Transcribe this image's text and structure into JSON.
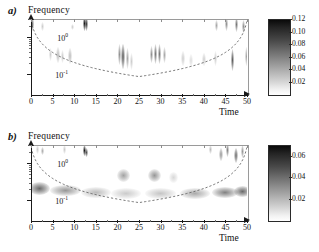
{
  "figure": {
    "type": "wavelet-scalogram-pair",
    "background": "#ffffff"
  },
  "panels": [
    {
      "tag": "a)",
      "ylabel": "Frequency",
      "xlabel": "Time"
    },
    {
      "tag": "b)",
      "ylabel": "Frequency",
      "xlabel": "Time"
    }
  ],
  "axes": {
    "x_ticks": [
      "0",
      "5",
      "10",
      "15",
      "20",
      "25",
      "30",
      "35",
      "40",
      "45",
      "50"
    ],
    "y_ticks": [
      "10",
      "10"
    ],
    "y_exponents": [
      "0",
      "-1"
    ]
  },
  "colorbars": [
    {
      "ticks": [
        "0.12",
        "0.10",
        "0.08",
        "0.06",
        "0.04",
        "0.02"
      ],
      "max": 0.12,
      "min": 0.0
    },
    {
      "ticks": [
        "0.06",
        "0.04",
        "0.02"
      ],
      "max": 0.07,
      "min": 0.0
    }
  ],
  "chart_data": {
    "type": "heatmap",
    "title": "",
    "xlabel": "Time",
    "ylabel": "Frequency",
    "xlim": [
      0,
      50
    ],
    "ylim_log": [
      0.03,
      3.0
    ],
    "grid": false,
    "colormap": "grayscale-inverted",
    "panels": [
      {
        "label": "a)",
        "zlim": [
          0.0,
          0.12
        ],
        "colorbar_ticks": [
          0.02,
          0.04,
          0.06,
          0.08,
          0.1,
          0.12
        ],
        "description": "Intermittent vertical bursts; sparse high-frequency spikes along top edge, isolated mid-frequency patches between t=20-32 and t=42-50",
        "features": [
          {
            "t": 0.4,
            "f": 2.2,
            "amp": 0.09,
            "wt": 0.5,
            "hf": 1.5
          },
          {
            "t": 2.6,
            "f": 1.9,
            "amp": 0.05,
            "wt": 0.6,
            "hf": 1.3
          },
          {
            "t": 4.6,
            "f": 0.34,
            "amp": 0.05,
            "wt": 0.7,
            "hf": 1.5
          },
          {
            "t": 6.3,
            "f": 0.33,
            "amp": 0.06,
            "wt": 0.8,
            "hf": 1.6
          },
          {
            "t": 7.4,
            "f": 0.3,
            "amp": 0.05,
            "wt": 0.7,
            "hf": 1.5
          },
          {
            "t": 9.0,
            "f": 0.31,
            "amp": 0.06,
            "wt": 0.8,
            "hf": 1.6
          },
          {
            "t": 9.5,
            "f": 1.8,
            "amp": 0.05,
            "wt": 0.5,
            "hf": 1.2
          },
          {
            "t": 12.4,
            "f": 2.3,
            "amp": 0.12,
            "wt": 0.45,
            "hf": 1.6
          },
          {
            "t": 12.9,
            "f": 2.2,
            "amp": 0.11,
            "wt": 0.4,
            "hf": 1.5
          },
          {
            "t": 20.4,
            "f": 0.33,
            "amp": 0.08,
            "wt": 0.7,
            "hf": 1.9
          },
          {
            "t": 21.3,
            "f": 0.3,
            "amp": 0.1,
            "wt": 0.75,
            "hf": 2.1
          },
          {
            "t": 22.3,
            "f": 0.27,
            "amp": 0.07,
            "wt": 0.8,
            "hf": 1.9
          },
          {
            "t": 23.3,
            "f": 0.22,
            "amp": 0.05,
            "wt": 0.8,
            "hf": 1.7
          },
          {
            "t": 27.8,
            "f": 0.34,
            "amp": 0.08,
            "wt": 0.55,
            "hf": 1.7
          },
          {
            "t": 28.8,
            "f": 0.35,
            "amp": 0.09,
            "wt": 0.5,
            "hf": 1.8
          },
          {
            "t": 29.8,
            "f": 0.35,
            "amp": 0.09,
            "wt": 0.5,
            "hf": 1.8
          },
          {
            "t": 30.8,
            "f": 0.33,
            "amp": 0.07,
            "wt": 0.5,
            "hf": 1.6
          },
          {
            "t": 35.2,
            "f": 0.26,
            "amp": 0.05,
            "wt": 0.8,
            "hf": 1.6
          },
          {
            "t": 37.0,
            "f": 0.24,
            "amp": 0.04,
            "wt": 0.9,
            "hf": 1.5
          },
          {
            "t": 40.0,
            "f": 0.25,
            "amp": 0.05,
            "wt": 0.8,
            "hf": 1.5
          },
          {
            "t": 42.6,
            "f": 0.27,
            "amp": 0.05,
            "wt": 0.7,
            "hf": 1.6
          },
          {
            "t": 43.0,
            "f": 2.0,
            "amp": 0.07,
            "wt": 0.5,
            "hf": 1.4
          },
          {
            "t": 45.2,
            "f": 2.2,
            "amp": 0.08,
            "wt": 0.5,
            "hf": 1.5
          },
          {
            "t": 46.6,
            "f": 0.24,
            "amp": 0.1,
            "wt": 0.8,
            "hf": 2.0
          },
          {
            "t": 47.6,
            "f": 2.1,
            "amp": 0.09,
            "wt": 0.5,
            "hf": 1.6
          },
          {
            "t": 49.3,
            "f": 1.9,
            "amp": 0.08,
            "wt": 0.6,
            "hf": 1.5
          },
          {
            "t": 49.8,
            "f": 0.3,
            "amp": 0.07,
            "wt": 0.6,
            "hf": 1.8
          }
        ]
      },
      {
        "label": "b)",
        "zlim": [
          0.0,
          0.07
        ],
        "colorbar_ticks": [
          0.02,
          0.04,
          0.06
        ],
        "description": "Persistent horizontal band near f=0.2 spanning full time range; additional band near f=0.45 between t=19-33; scattered high-frequency spots",
        "features": [
          {
            "t": 2.0,
            "f": 0.21,
            "amp": 0.055,
            "wt": 5.0,
            "hf": 1.5
          },
          {
            "t": 8.0,
            "f": 0.185,
            "amp": 0.045,
            "wt": 7.0,
            "hf": 1.4
          },
          {
            "t": 15.0,
            "f": 0.165,
            "amp": 0.035,
            "wt": 7.0,
            "hf": 1.4
          },
          {
            "t": 22.0,
            "f": 0.155,
            "amp": 0.03,
            "wt": 7.0,
            "hf": 1.4
          },
          {
            "t": 30.0,
            "f": 0.15,
            "amp": 0.032,
            "wt": 7.0,
            "hf": 1.4
          },
          {
            "t": 38.0,
            "f": 0.155,
            "amp": 0.04,
            "wt": 7.0,
            "hf": 1.4
          },
          {
            "t": 45.0,
            "f": 0.165,
            "amp": 0.05,
            "wt": 6.0,
            "hf": 1.4
          },
          {
            "t": 49.0,
            "f": 0.175,
            "amp": 0.055,
            "wt": 4.0,
            "hf": 1.4
          },
          {
            "t": 21.5,
            "f": 0.46,
            "amp": 0.042,
            "wt": 3.0,
            "hf": 1.5
          },
          {
            "t": 28.5,
            "f": 0.47,
            "amp": 0.045,
            "wt": 3.0,
            "hf": 1.5
          },
          {
            "t": 33.0,
            "f": 0.4,
            "amp": 0.025,
            "wt": 2.0,
            "hf": 1.4
          },
          {
            "t": 1.5,
            "f": 2.3,
            "amp": 0.03,
            "wt": 0.5,
            "hf": 1.3
          },
          {
            "t": 2.6,
            "f": 2.1,
            "amp": 0.04,
            "wt": 0.5,
            "hf": 1.3
          },
          {
            "t": 7.8,
            "f": 2.3,
            "amp": 0.03,
            "wt": 0.4,
            "hf": 1.3
          },
          {
            "t": 12.3,
            "f": 2.1,
            "amp": 0.07,
            "wt": 0.5,
            "hf": 1.4
          },
          {
            "t": 12.8,
            "f": 1.9,
            "amp": 0.06,
            "wt": 0.4,
            "hf": 1.3
          },
          {
            "t": 41.5,
            "f": 2.3,
            "amp": 0.035,
            "wt": 0.6,
            "hf": 1.3
          },
          {
            "t": 44.0,
            "f": 1.7,
            "amp": 0.045,
            "wt": 0.8,
            "hf": 1.5
          },
          {
            "t": 45.5,
            "f": 2.2,
            "amp": 0.05,
            "wt": 0.7,
            "hf": 1.5
          },
          {
            "t": 47.5,
            "f": 1.6,
            "amp": 0.055,
            "wt": 0.9,
            "hf": 1.6
          },
          {
            "t": 49.0,
            "f": 2.0,
            "amp": 0.045,
            "wt": 0.7,
            "hf": 1.5
          }
        ]
      }
    ],
    "cone_of_influence": {
      "style": "dashed",
      "color": "#555555",
      "description": "U-shaped dashed curve, minimum frequency at t=25"
    }
  }
}
